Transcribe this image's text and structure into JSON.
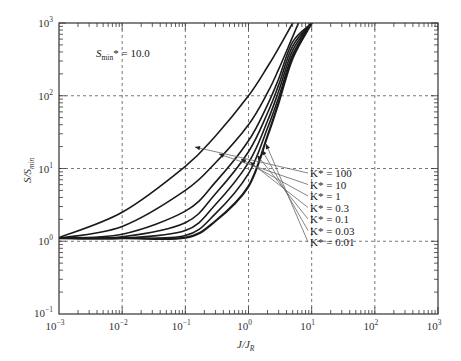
{
  "chart_data": {
    "type": "line",
    "title": "",
    "xlabel": "J/J_R",
    "ylabel": "S/S_min",
    "xscale": "log",
    "yscale": "log",
    "xlim": [
      0.001,
      1000
    ],
    "ylim": [
      0.1,
      1000
    ],
    "grid": true,
    "x_tick_labels": [
      "10^-3",
      "10^-2",
      "10^-1",
      "10^0",
      "10^1",
      "10^2",
      "10^3"
    ],
    "y_tick_labels": [
      "10^-1",
      "10^0",
      "10^1",
      "10^2",
      "10^3"
    ],
    "annotation": "S_min* = 10.0",
    "x": [
      0.001,
      0.01,
      0.1,
      0.3,
      1,
      2,
      3,
      5,
      10
    ],
    "series": [
      {
        "name": "K* = 100",
        "values": [
          1.12,
          2.5,
          10.7,
          28,
          100,
          250,
          450,
          1000,
          null
        ]
      },
      {
        "name": "K* = 10",
        "values": [
          1.1,
          1.6,
          5.0,
          12,
          40,
          110,
          230,
          650,
          null
        ]
      },
      {
        "name": "K* = 1",
        "values": [
          1.1,
          1.25,
          2.6,
          6.5,
          24,
          75,
          170,
          550,
          1000
        ]
      },
      {
        "name": "K* = 0.3",
        "values": [
          1.1,
          1.15,
          1.8,
          4.5,
          17,
          58,
          140,
          480,
          1000
        ]
      },
      {
        "name": "K* = 0.1",
        "values": [
          1.1,
          1.1,
          1.4,
          3.2,
          12,
          45,
          115,
          420,
          1000
        ]
      },
      {
        "name": "K* = 0.03",
        "values": [
          1.1,
          1.1,
          1.2,
          2.4,
          8.5,
          36,
          95,
          370,
          1000
        ]
      },
      {
        "name": "K* = 0.01",
        "values": [
          1.1,
          1.1,
          1.12,
          1.9,
          5.7,
          28,
          80,
          330,
          1000
        ]
      }
    ],
    "legend_position": "right-middle (arrow callouts)"
  },
  "labels": {
    "y_axis": "S/S",
    "y_axis_sub": "min",
    "x_axis": "J/J",
    "x_axis_sub": "R",
    "annot_main": "S",
    "annot_sub": "min",
    "annot_rest": "* = 10.0",
    "legend": [
      "K* = 100",
      "K* = 10",
      "K* = 1",
      "K* = 0.3",
      "K* = 0.1",
      "K* = 0.03",
      "K* = 0.01"
    ]
  }
}
